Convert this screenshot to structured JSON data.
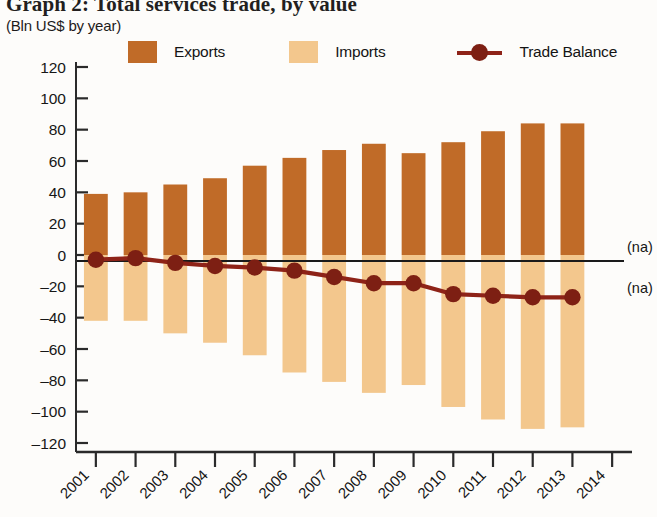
{
  "title": "Graph 2: Total services trade, by value",
  "subtitle": "(Bln US$ by year)",
  "legend": {
    "exports_label": "Exports",
    "imports_label": "Imports",
    "balance_label": "Trade Balance"
  },
  "annotations": {
    "na_upper": "(na)",
    "na_lower": "(na)"
  },
  "colors": {
    "exports": "#C06B28",
    "imports": "#F3C78D",
    "balance": "#8E2318",
    "axis": "#1a1a1a"
  },
  "chart_data": {
    "type": "bar",
    "title": "Graph 2: Total services trade, by value",
    "subtitle": "(Bln US$ by year)",
    "xlabel": "",
    "ylabel": "Bln US$ by year",
    "ylim": [
      -120,
      120
    ],
    "ytick_step": 20,
    "yticks": [
      120,
      100,
      80,
      60,
      40,
      20,
      0,
      -20,
      -40,
      -60,
      -80,
      -100,
      -120
    ],
    "ytick_labels": [
      "120",
      "100",
      "80",
      "60",
      "40",
      "20",
      "0",
      "–20",
      "–40",
      "–60",
      "–80",
      "–100",
      "–120"
    ],
    "categories": [
      "2001",
      "2002",
      "2003",
      "2004",
      "2005",
      "2006",
      "2007",
      "2008",
      "2009",
      "2010",
      "2011",
      "2012",
      "2013",
      "2014"
    ],
    "grid": false,
    "legend_position": "top",
    "series": [
      {
        "name": "Exports",
        "type": "bar",
        "color": "#C06B28",
        "values": [
          39,
          40,
          45,
          49,
          57,
          62,
          67,
          71,
          65,
          72,
          79,
          84,
          84,
          null
        ]
      },
      {
        "name": "Imports",
        "type": "bar",
        "color": "#F3C78D",
        "values": [
          -42,
          -42,
          -50,
          -56,
          -64,
          -75,
          -81,
          -88,
          -83,
          -97,
          -105,
          -111,
          -110,
          null
        ]
      },
      {
        "name": "Trade Balance",
        "type": "line",
        "color": "#8E2318",
        "values": [
          -3,
          -2,
          -5,
          -7,
          -8,
          -10,
          -14,
          -18,
          -18,
          -25,
          -26,
          -27,
          -27,
          null
        ]
      }
    ],
    "notes": [
      "(na)",
      "(na)"
    ]
  }
}
